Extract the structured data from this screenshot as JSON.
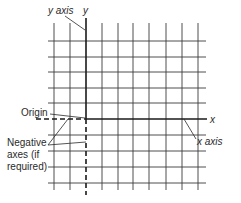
{
  "diagram": {
    "type": "cartesian-grid",
    "colors": {
      "line": "#3a3a3a",
      "axis": "#1a1a1a",
      "text": "#2a2a2a",
      "background": "#ffffff"
    },
    "grid": {
      "vertical_x": [
        54,
        70,
        102,
        118,
        133,
        149,
        166,
        182,
        198
      ],
      "horizontal_y": [
        41,
        57,
        72,
        88,
        103,
        135,
        151,
        167,
        183
      ],
      "x_extent": [
        48,
        206
      ],
      "y_extent": [
        23,
        190
      ]
    },
    "axes": {
      "y_axis": {
        "x": 86,
        "label": "y",
        "callout": "y axis"
      },
      "x_axis": {
        "y": 119,
        "label": "x",
        "callout": "x axis"
      }
    },
    "labels": {
      "y_letter": "y",
      "y_axis_callout": "y axis",
      "x_letter": "x",
      "x_axis_callout": "x axis",
      "origin": "Origin",
      "negative_line1": "Negative",
      "negative_line2": "axes (if",
      "negative_line3": "required)"
    }
  }
}
